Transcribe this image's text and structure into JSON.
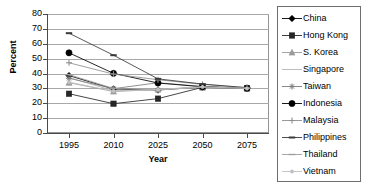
{
  "chart_data": {
    "type": "line",
    "title": "",
    "xlabel": "Year",
    "ylabel": "Percent",
    "x": [
      1995,
      2010,
      2025,
      2050,
      2075
    ],
    "categories": [
      "1995",
      "2010",
      "2025",
      "2050",
      "2075"
    ],
    "xlim": [
      1995,
      2075
    ],
    "ylim": [
      0,
      80
    ],
    "yticks": [
      0,
      10,
      20,
      30,
      40,
      50,
      60,
      70,
      80
    ],
    "ytick_labels": [
      "0",
      "10",
      "20",
      "30",
      "40",
      "50",
      "60",
      "70",
      "80"
    ],
    "xtick_labels": [
      "1995",
      "2010",
      "2025",
      "2050",
      "2075"
    ],
    "grid": "horizontal",
    "legend_position": "right",
    "series": [
      {
        "name": "China",
        "marker": "diamond-filled",
        "color": "#000000",
        "values": [
          38.6,
          29.6,
          28.9,
          30.9,
          30.2
        ]
      },
      {
        "name": "Hong Kong",
        "marker": "square-filled",
        "color": "#262626",
        "values": [
          26.4,
          19.7,
          23.1,
          30.7,
          30.0
        ]
      },
      {
        "name": "S. Korea",
        "marker": "triangle",
        "color": "#9a9a9a",
        "values": [
          33.8,
          27.9,
          29.2,
          31.0,
          30.1
        ]
      },
      {
        "name": "Singapore",
        "marker": "none",
        "color": "#b4b4b4",
        "values": [
          37.3,
          28.4,
          29.0,
          30.8,
          30.0
        ]
      },
      {
        "name": "Taiwan",
        "marker": "star",
        "color": "#7d7d7d",
        "values": [
          36.8,
          29.8,
          33.8,
          31.2,
          30.3
        ]
      },
      {
        "name": "Indonesia",
        "marker": "circle-filled",
        "color": "#000000",
        "values": [
          53.9,
          40.1,
          33.6,
          31.1,
          30.1
        ]
      },
      {
        "name": "Malaysia",
        "marker": "plus",
        "color": "#8f8f8f",
        "values": [
          47.2,
          39.6,
          35.8,
          32.7,
          30.4
        ]
      },
      {
        "name": "Philippines",
        "marker": "dash",
        "color": "#3a3a3a",
        "values": [
          67.1,
          52.3,
          36.4,
          32.9,
          30.5
        ]
      },
      {
        "name": "Thailand",
        "marker": "line",
        "color": "#9e9e9e",
        "values": [
          39.2,
          30.0,
          29.1,
          30.9,
          30.1
        ]
      },
      {
        "name": "Vietnam",
        "marker": "dot",
        "color": "#c0c0c0",
        "values": [
          34.2,
          28.2,
          29.3,
          31.0,
          30.0
        ]
      }
    ]
  },
  "legend": {
    "items": [
      {
        "label": "China"
      },
      {
        "label": "Hong Kong"
      },
      {
        "label": "S. Korea"
      },
      {
        "label": "Singapore"
      },
      {
        "label": "Taiwan"
      },
      {
        "label": "Indonesia"
      },
      {
        "label": "Malaysia"
      },
      {
        "label": "Philippines"
      },
      {
        "label": "Thailand"
      },
      {
        "label": "Vietnam"
      }
    ]
  },
  "axes": {
    "y_title": "Percent",
    "x_title": "Year"
  }
}
